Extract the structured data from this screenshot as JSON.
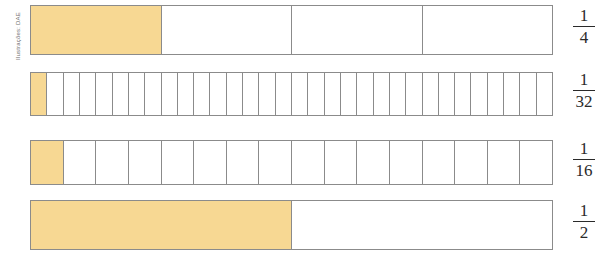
{
  "credit": {
    "text": "Ilustrações: DAE"
  },
  "colors": {
    "fill": "#f7d893",
    "border": "#8b8b8b",
    "background": "#ffffff",
    "text": "#2a2a2a"
  },
  "chart_data": {
    "type": "bar",
    "title": "",
    "subtitle": "",
    "xlabel": "",
    "ylabel": "",
    "grid": false,
    "legend": "none",
    "categories": [
      "1/4",
      "1/32",
      "1/16",
      "1/2"
    ],
    "values": [
      0.25,
      0.03125,
      0.0625,
      0.5
    ],
    "bars": [
      {
        "label": "1/4",
        "numerator": "1",
        "denominator": "4",
        "segments": 4,
        "filled": 1,
        "value": 0.25
      },
      {
        "label": "1/32",
        "numerator": "1",
        "denominator": "32",
        "segments": 32,
        "filled": 1,
        "value": 0.03125
      },
      {
        "label": "1/16",
        "numerator": "1",
        "denominator": "16",
        "segments": 16,
        "filled": 1,
        "value": 0.0625
      },
      {
        "label": "1/2",
        "numerator": "1",
        "denominator": "2",
        "segments": 2,
        "filled": 1,
        "value": 0.5
      }
    ]
  }
}
